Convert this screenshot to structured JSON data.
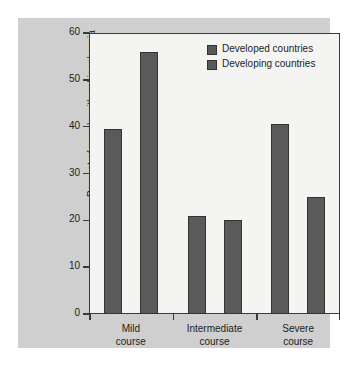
{
  "chart_data": {
    "type": "bar",
    "title": "",
    "subtitle": "",
    "xlabel": "",
    "ylabel": "Percent of people with schizophrenia",
    "ylim": [
      0,
      60
    ],
    "yticks": [
      0,
      10,
      20,
      30,
      40,
      50,
      60
    ],
    "ytick_labels": [
      "0",
      "10",
      "20",
      "30",
      "40",
      "50",
      "60"
    ],
    "grid": false,
    "legend_position": "top-right",
    "categories": [
      "Mild course",
      "Intermediate course",
      "Severe course"
    ],
    "category_lines": [
      [
        "Mild",
        "course"
      ],
      [
        "Intermediate",
        "course"
      ],
      [
        "Severe",
        "course"
      ]
    ],
    "series": [
      {
        "name": "Developed countries",
        "values": [
          39.5,
          21,
          40.5
        ],
        "color": "#5a5a5a"
      },
      {
        "name": "Developing countries",
        "values": [
          56,
          20,
          25
        ],
        "color": "#5a5a5a"
      }
    ],
    "annotations": []
  },
  "legend": {
    "entries": [
      {
        "label": "Developed countries",
        "swatch_color": "#5a5a5a"
      },
      {
        "label": "Developing countries",
        "swatch_color": "#5a5a5a"
      }
    ]
  },
  "colors": {
    "figure_background": "#ffffff",
    "panel_background": "#cfcfcf",
    "plot_background": "#f4f4f2",
    "axis": "#3a3a3a",
    "bar": "#5a5a5a",
    "text": "#1d1d1d"
  }
}
